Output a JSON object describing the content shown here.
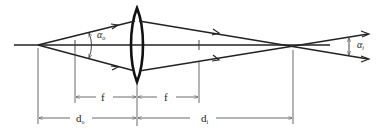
{
  "diagram": {
    "type": "thin-lens-ray-diagram",
    "colors": {
      "ink": "#222222",
      "thin": "#555555",
      "background": "#ffffff"
    },
    "labels": {
      "object_angle": "α",
      "object_angle_sub": "o",
      "image_angle": "α",
      "image_angle_sub": "i",
      "focal_left": "f",
      "focal_right": "f",
      "object_distance": "d",
      "object_distance_sub": "o",
      "image_distance": "d",
      "image_distance_sub": "i"
    },
    "elements": {
      "optical_axis": "optical-axis",
      "lens": "converging-lens",
      "object_point": "object-point",
      "image_point": "image-point"
    }
  }
}
